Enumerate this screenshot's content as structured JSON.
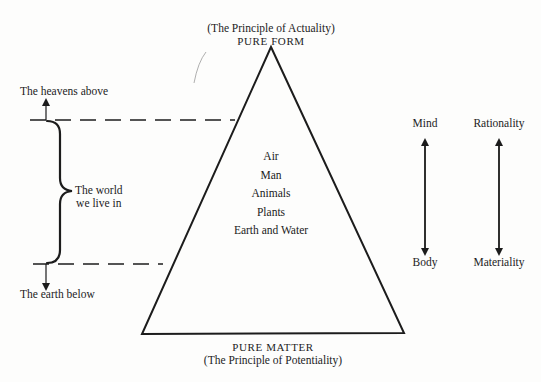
{
  "top_label": {
    "principle": "(The Principle of Actuality)",
    "title": "PURE FORM"
  },
  "bottom_label": {
    "title": "PURE MATTER",
    "principle": "(The Principle of Potentiality)"
  },
  "hierarchy": [
    {
      "label": "Air"
    },
    {
      "label": "Man"
    },
    {
      "label": "Animals"
    },
    {
      "label": "Plants"
    },
    {
      "label": "Earth and Water"
    }
  ],
  "left_scale": {
    "above": "The heavens above",
    "world_line1": "The world",
    "world_line2": "we live in",
    "below": "The earth below"
  },
  "right_scales": [
    {
      "top": "Mind",
      "bottom": "Body"
    },
    {
      "top": "Rationality",
      "bottom": "Materiality"
    }
  ],
  "colors": {
    "ink": "#1c1c1c",
    "paper": "#fdfdfc"
  }
}
